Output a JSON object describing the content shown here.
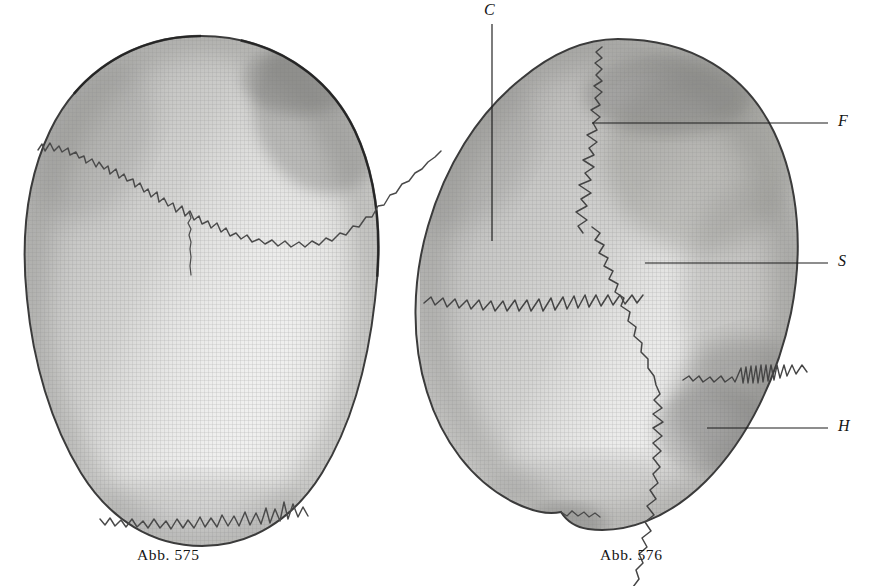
{
  "plate": {
    "title": "Schädeldach von oben",
    "background_color": "#ffffff",
    "ink_color": "#2b2b2b",
    "bone_light": "#f1f1f0",
    "bone_mid": "#d6d6d4",
    "bone_shadow": "#9b9b99",
    "outline_color": "#3a3a3a",
    "cut_text_top": "g                                      (              )"
  },
  "figures": [
    {
      "id": "abb-575",
      "caption": "Abb. 575",
      "description": "Schädeldach von oben, langer ovaler Umriss",
      "sutures": [
        "Sutura coronalis",
        "Sutura lambdoidea",
        "Rest der Sutura frontalis"
      ]
    },
    {
      "id": "abb-576",
      "caption": "Abb. 576",
      "description": "Schädeldach von oben, rundlicher Umriss mit bezeichneten Nähten",
      "sutures": [
        "Sutura coronalis",
        "Sutura sagittalis",
        "Sutura lambdoidea"
      ]
    }
  ],
  "labels": [
    {
      "key": "C",
      "letter": "C",
      "name": "sutura-coronalis",
      "leader": "vertical"
    },
    {
      "key": "F",
      "letter": "F",
      "name": "os-frontale-naht",
      "leader": "horizontal"
    },
    {
      "key": "S",
      "letter": "S",
      "name": "sutura-sagittalis",
      "leader": "horizontal"
    },
    {
      "key": "H",
      "letter": "H",
      "name": "os-occipitale",
      "leader": "horizontal"
    }
  ],
  "leader_lines": [
    {
      "key": "C",
      "x1": 492,
      "y1": 24,
      "x2": 492,
      "y2": 241
    },
    {
      "key": "F",
      "x1": 592,
      "y1": 123,
      "x2": 828,
      "y2": 123
    },
    {
      "key": "S",
      "x1": 645,
      "y1": 263,
      "x2": 828,
      "y2": 263
    },
    {
      "key": "H",
      "x1": 707,
      "y1": 428,
      "x2": 828,
      "y2": 428
    }
  ]
}
